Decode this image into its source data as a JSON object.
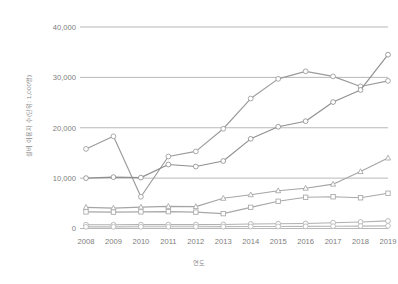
{
  "chart": {
    "type": "line",
    "background_color": "#ffffff",
    "gridline_color": "#9a9a9a",
    "tick_label_color": "#7d7d7d",
    "axis_title_color": "#8a8a8a"
  },
  "chart_data": {
    "type": "line",
    "title": "",
    "subtitle": "",
    "xlabel": "연도",
    "ylabel": "설비 이용자 수(단위: 1,000명)",
    "grid": true,
    "grid_axis": "y",
    "legend": false,
    "legend_position": "none",
    "x": [
      2008,
      2009,
      2010,
      2011,
      2012,
      2013,
      2014,
      2015,
      2016,
      2017,
      2018,
      2019
    ],
    "categories": [
      "2008",
      "2009",
      "2010",
      "2011",
      "2012",
      "2013",
      "2014",
      "2015",
      "2016",
      "2017",
      "2018",
      "2019"
    ],
    "xlim": [
      2008,
      2019
    ],
    "ylim": [
      0,
      40000
    ],
    "ytick_values": [
      0,
      10000,
      20000,
      30000,
      40000
    ],
    "ytick_labels": [
      "0",
      "10,000",
      "20,000",
      "30,000",
      "40,000"
    ],
    "series": [
      {
        "name": "series-1",
        "color": "#9b9b9b",
        "marker": "circle",
        "values": [
          15800,
          18300,
          6300,
          14300,
          15300,
          19800,
          25800,
          29700,
          31200,
          30200,
          28200,
          29300
        ]
      },
      {
        "name": "series-2",
        "color": "#8f8f8f",
        "marker": "circle",
        "values": [
          10000,
          10200,
          10100,
          12700,
          12300,
          13400,
          17800,
          20200,
          21300,
          25100,
          27500,
          34500
        ]
      },
      {
        "name": "series-3",
        "color": "#a5a5a5",
        "marker": "triangle",
        "values": [
          4200,
          4050,
          4250,
          4400,
          4350,
          6000,
          6700,
          7500,
          8000,
          8800,
          11300,
          14000
        ]
      },
      {
        "name": "series-4",
        "color": "#a8a8a8",
        "marker": "square",
        "values": [
          3300,
          3250,
          3300,
          3350,
          3250,
          2950,
          4200,
          5400,
          6200,
          6300,
          6100,
          7000
        ]
      },
      {
        "name": "series-5",
        "color": "#b0b0b0",
        "marker": "circle",
        "values": [
          750,
          740,
          760,
          770,
          780,
          800,
          900,
          950,
          1000,
          1150,
          1300,
          1500
        ]
      },
      {
        "name": "series-6",
        "color": "#b8b8b8",
        "marker": "circle",
        "values": [
          330,
          330,
          340,
          350,
          350,
          360,
          390,
          400,
          420,
          450,
          480,
          520
        ]
      }
    ]
  }
}
